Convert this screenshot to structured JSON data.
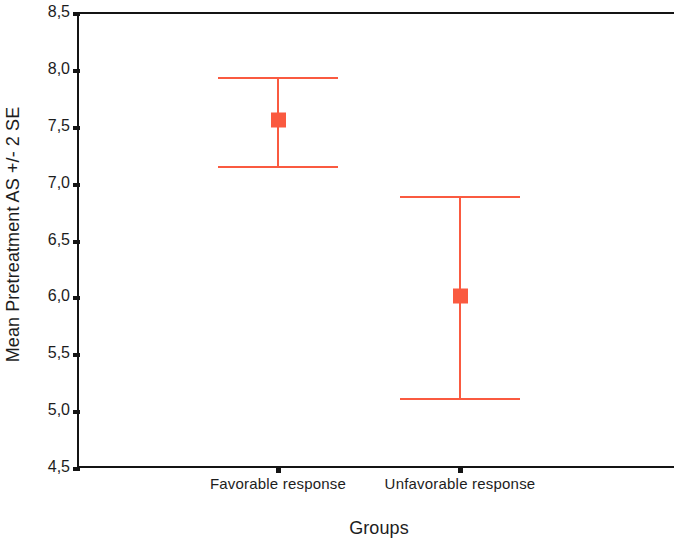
{
  "chart_data": {
    "type": "scatter",
    "title": "",
    "subtitle": "",
    "xlabel": "Groups",
    "ylabel": "Mean Pretreatment AS +/- 2 SE",
    "categories": [
      "Favorable response",
      "Unfavorable response"
    ],
    "values": [
      7.55,
      6.0
    ],
    "error_low": [
      7.15,
      5.11
    ],
    "error_high": [
      7.93,
      6.88
    ],
    "series": [
      {
        "name": "Mean Pretreatment AS +/- 2 SE",
        "points": [
          {
            "category": "Favorable response",
            "mean": 7.55,
            "lower": 7.15,
            "upper": 7.93
          },
          {
            "category": "Unfavorable response",
            "mean": 6.0,
            "lower": 5.11,
            "upper": 6.88
          }
        ]
      }
    ],
    "ylim": [
      4.5,
      8.5
    ],
    "ytick_labels": [
      "8,5",
      "8,0",
      "7,5",
      "7,0",
      "6,5",
      "6,0",
      "5,5",
      "5,0",
      "4,5"
    ],
    "ytick_values": [
      8.5,
      8.0,
      7.5,
      7.0,
      6.5,
      6.0,
      5.5,
      5.0,
      4.5
    ],
    "grid": false,
    "legend": false,
    "legend_position": "none",
    "marker": "square",
    "accent_color": "#fa5a40",
    "axis_color": "#141414",
    "background_color": "#ffffff",
    "error_bar_description": "+/- 2 SE"
  }
}
